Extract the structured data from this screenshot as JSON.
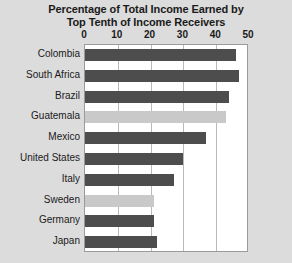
{
  "chart_data": {
    "type": "bar",
    "orientation": "horizontal",
    "title": "Percentage of Total Income Earned by Top Tenth of Income Receivers",
    "title_lines": [
      "Percentage of Total Income Earned by",
      "Top Tenth of Income Receivers"
    ],
    "xlabel": "",
    "ylabel": "",
    "xlim": [
      0,
      50
    ],
    "ticks": [
      0,
      10,
      20,
      30,
      40,
      50
    ],
    "tick_labels": [
      "0",
      "10",
      "20",
      "30",
      "40",
      "50"
    ],
    "grid": true,
    "legend": "none",
    "categories": [
      "Colombia",
      "South Africa",
      "Brazil",
      "Guatemala",
      "Mexico",
      "United States",
      "Italy",
      "Sweden",
      "Germany",
      "Japan"
    ],
    "values": [
      46,
      47,
      44,
      43,
      37,
      30,
      27,
      21,
      21,
      22
    ],
    "bar_shades": [
      "dark",
      "dark",
      "dark",
      "light",
      "dark",
      "dark",
      "dark",
      "light",
      "dark",
      "dark"
    ],
    "colors": {
      "bar_dark": "#4d4d4d",
      "bar_light": "#c9c9c9",
      "plot_background": "#ffffff",
      "page_background": "#dcdcdc",
      "gridline": "#b9b9b9",
      "text": "#1a1a1a"
    }
  }
}
